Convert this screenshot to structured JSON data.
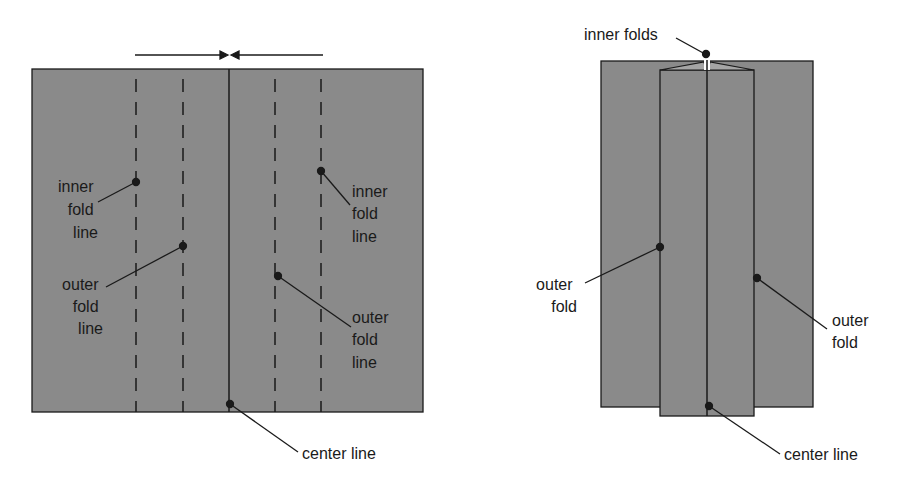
{
  "colors": {
    "paper": "#8a8a8a",
    "line": "#1a1a1a",
    "background": "#ffffff"
  },
  "left_diagram": {
    "labels": {
      "inner_left": [
        "inner",
        "fold",
        "line"
      ],
      "outer_left": [
        "outer",
        "fold",
        "line"
      ],
      "inner_right": [
        "inner",
        "fold",
        "line"
      ],
      "outer_right": [
        "outer",
        "fold",
        "line"
      ],
      "center": "center line"
    },
    "arrows": "fold edges toward center"
  },
  "right_diagram": {
    "labels": {
      "inner_folds": "inner folds",
      "outer_left": [
        "outer",
        "fold"
      ],
      "outer_right": [
        "outer",
        "fold"
      ],
      "center": "center line"
    }
  }
}
